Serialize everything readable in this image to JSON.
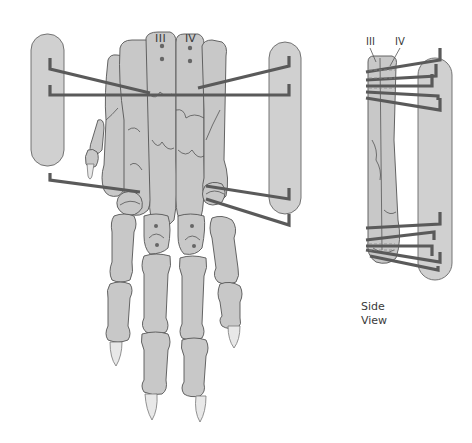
{
  "figure": {
    "labels": {
      "bone_iii": "III",
      "bone_iv": "IV",
      "side_bone_iii": "III",
      "side_bone_iv": "IV",
      "side_view_line1": "Side",
      "side_view_line2": "View"
    },
    "colors": {
      "bone_fill": "#c8c8c8",
      "bone_stroke": "#555555",
      "bar_fill": "#d0d0d0",
      "pin": "#5a5a5a",
      "claw": "#e8e8e8",
      "background": "#ffffff"
    },
    "views": [
      {
        "name": "dorsal-view",
        "pins_left": 3,
        "pins_right": 3,
        "connecting_bars": 2
      },
      {
        "name": "side-view",
        "pins": 6,
        "connecting_bars": 1
      }
    ]
  }
}
